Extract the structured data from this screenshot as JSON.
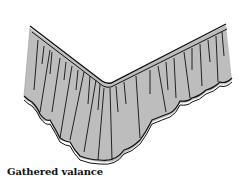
{
  "illustration": {
    "subject": "gathered bed valance (bed skirt) shown at a corner",
    "fill_color": "#bdbdbd",
    "line_color": "#111111",
    "background_color": "#ffffff"
  },
  "caption": {
    "text": "Gathered valance"
  }
}
